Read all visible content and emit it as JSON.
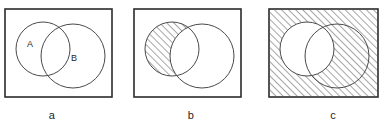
{
  "figure": {
    "background_color": "#ffffff",
    "stroke_color": "#2b2b2b",
    "hatch_color": "#3a3a3a",
    "panels": [
      {
        "id": "a",
        "caption": "a",
        "description": "Universe rectangle containing two overlapping circles labelled A and B, no shading",
        "shaded_region": "none",
        "labels": {
          "circle_a": "A",
          "circle_b": "B"
        },
        "show_labels": true,
        "box": {
          "x": 5,
          "y": 9,
          "width": 107,
          "height": 88
        },
        "circle_a": {
          "cx": 43,
          "cy": 49,
          "r": 27
        },
        "circle_b": {
          "cx": 73,
          "cy": 56,
          "r": 32
        },
        "label_a_pos": {
          "x": 27,
          "y": 47
        },
        "label_b_pos": {
          "x": 71,
          "y": 61
        }
      },
      {
        "id": "b",
        "caption": "b",
        "description": "Universe rectangle with two overlapping circles; the part of circle A outside circle B is hatched",
        "shaded_region": "A minus B",
        "labels": {
          "circle_a": "A",
          "circle_b": "B"
        },
        "show_labels": false,
        "box": {
          "x": 5,
          "y": 9,
          "width": 107,
          "height": 88
        },
        "circle_a": {
          "cx": 43,
          "cy": 49,
          "r": 27
        },
        "circle_b": {
          "cx": 73,
          "cy": 56,
          "r": 32
        },
        "label_a_pos": {
          "x": 27,
          "y": 47
        },
        "label_b_pos": {
          "x": 71,
          "y": 61
        }
      },
      {
        "id": "c",
        "caption": "c",
        "description": "Universe rectangle with two overlapping circles; everything except circle A is hatched",
        "shaded_region": "complement of A",
        "labels": {
          "circle_a": "A",
          "circle_b": "B"
        },
        "show_labels": false,
        "box": {
          "x": 5,
          "y": 9,
          "width": 109,
          "height": 88
        },
        "circle_a": {
          "cx": 43,
          "cy": 49,
          "r": 27
        },
        "circle_b": {
          "cx": 73,
          "cy": 56,
          "r": 32
        },
        "label_a_pos": {
          "x": 27,
          "y": 47
        },
        "label_b_pos": {
          "x": 71,
          "y": 61
        }
      }
    ],
    "hatch": {
      "angle_degrees": 45,
      "spacing_px": 5,
      "line_width_px": 0.9
    }
  }
}
